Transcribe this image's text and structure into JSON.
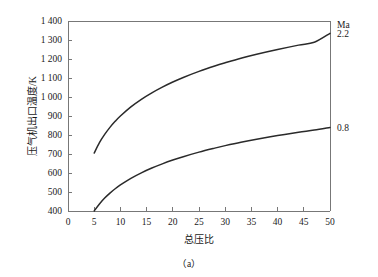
{
  "chart_data": {
    "type": "line",
    "title": "",
    "subtitle": "",
    "caption": "（a）",
    "xlabel": "总压比",
    "ylabel": "压气机出口温度/K",
    "xlim": [
      0,
      50
    ],
    "ylim": [
      400,
      1400
    ],
    "grid": false,
    "legend_position": "right-outside",
    "legend_header": "Ma",
    "xticks": [
      0,
      5,
      10,
      15,
      20,
      25,
      30,
      35,
      40,
      45,
      50
    ],
    "xtick_labels": [
      "0",
      "5",
      "10",
      "15",
      "20",
      "25",
      "30",
      "35",
      "40",
      "45",
      "50"
    ],
    "yticks": [
      400,
      500,
      600,
      700,
      800,
      900,
      1000,
      1100,
      1200,
      1300,
      1400
    ],
    "ytick_labels": [
      "400",
      "500",
      "600",
      "700",
      "800",
      "900",
      "1 000",
      "1 100",
      "1 200",
      "1 300",
      "1 400"
    ],
    "series": [
      {
        "name": "2.2",
        "label": "2.2",
        "color": "#2a2a2a",
        "x": [
          5,
          6,
          7,
          8,
          9,
          10,
          12,
          14,
          16,
          18,
          20,
          22,
          25,
          28,
          30,
          33,
          36,
          40,
          44,
          47,
          50
        ],
        "values": [
          705,
          760,
          803,
          840,
          872,
          900,
          948,
          988,
          1022,
          1052,
          1079,
          1103,
          1135,
          1163,
          1180,
          1204,
          1225,
          1250,
          1273,
          1288,
          1335
        ]
      },
      {
        "name": "0.8",
        "label": "0.8",
        "color": "#2a2a2a",
        "x": [
          5,
          6,
          7,
          8,
          9,
          10,
          12,
          14,
          16,
          18,
          20,
          22,
          25,
          28,
          30,
          33,
          36,
          40,
          44,
          47,
          50
        ],
        "values": [
          400,
          437,
          468,
          494,
          517,
          537,
          572,
          601,
          626,
          648,
          668,
          686,
          710,
          731,
          744,
          762,
          778,
          797,
          814,
          826,
          840
        ]
      }
    ]
  },
  "axes": {
    "y_axis_name": "y-axis",
    "x_axis_name": "x-axis"
  }
}
